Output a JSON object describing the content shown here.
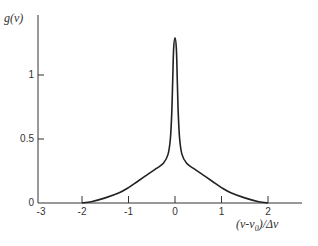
{
  "chart_data": {
    "type": "line",
    "title": "",
    "xlabel": "(ν-ν0)/Δν",
    "ylabel": "g(ν)",
    "xlim": [
      -3,
      2.7
    ],
    "ylim": [
      0,
      1.4
    ],
    "grid": false,
    "legend": null,
    "xticks": [
      -3,
      -2,
      -1,
      0,
      1,
      2
    ],
    "xtick_labels": [
      "-3",
      "-2",
      "-1",
      "0",
      "1",
      "2"
    ],
    "yticks": [
      0,
      0.5,
      1
    ],
    "ytick_labels": [
      "0",
      "0.5",
      "1"
    ],
    "series": [
      {
        "name": "g(ν)",
        "x": [
          -2.0,
          -1.8,
          -1.5,
          -1.2,
          -1.0,
          -0.8,
          -0.6,
          -0.4,
          -0.25,
          -0.15,
          -0.1,
          -0.07,
          -0.05,
          -0.03,
          0.0,
          0.03,
          0.05,
          0.07,
          0.1,
          0.15,
          0.25,
          0.4,
          0.6,
          0.8,
          1.0,
          1.2,
          1.5,
          1.8,
          2.0
        ],
        "y": [
          0.0,
          0.01,
          0.04,
          0.08,
          0.12,
          0.17,
          0.22,
          0.27,
          0.31,
          0.38,
          0.5,
          0.7,
          0.95,
          1.2,
          1.29,
          1.2,
          0.95,
          0.7,
          0.5,
          0.38,
          0.31,
          0.27,
          0.22,
          0.17,
          0.12,
          0.08,
          0.04,
          0.01,
          0.0
        ]
      }
    ]
  },
  "labels": {
    "ylabel": "g(ν)",
    "xlabel_main": "(ν-ν",
    "xlabel_sub": "0",
    "xlabel_tail": ")/Δν"
  }
}
